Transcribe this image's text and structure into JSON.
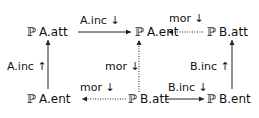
{
  "nodes": {
    "top_left": {
      "prefix": "ℙ",
      "label": "A.att"
    },
    "top_mid": {
      "prefix": "ℙ",
      "label": "A.ent"
    },
    "top_right": {
      "prefix": "ℙ",
      "label": "B.att"
    },
    "bottom_left": {
      "prefix": "ℙ",
      "label": "A.ent"
    },
    "bottom_mid": {
      "prefix": "ℙ",
      "label": "B.att"
    },
    "bottom_right": {
      "prefix": "ℙ",
      "label": "B.ent"
    }
  },
  "arrows": {
    "top_left_to_mid": {
      "label": "A.inc ↓",
      "style": "solid"
    },
    "top_right_to_mid": {
      "label": "mor ↓",
      "style": "dotted"
    },
    "left_bottom_to_top": {
      "label": "A.inc ↑",
      "style": "solid"
    },
    "mid_bottom_to_top": {
      "label": "mor ↓",
      "style": "dotted"
    },
    "right_bottom_to_top": {
      "label": "B.inc ↑",
      "style": "solid"
    },
    "bottom_mid_to_left": {
      "label": "mor ↓",
      "style": "dotted"
    },
    "bottom_mid_to_right": {
      "label": "B.inc ↓",
      "style": "solid"
    }
  }
}
